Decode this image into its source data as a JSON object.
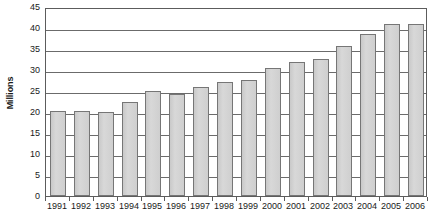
{
  "chart_data": {
    "type": "bar",
    "title": "",
    "subtitle": "",
    "xlabel": "",
    "ylabel": "Millions",
    "categories": [
      "1991",
      "1992",
      "1993",
      "1994",
      "1995",
      "1996",
      "1997",
      "1998",
      "1999",
      "2000",
      "2001",
      "2002",
      "2003",
      "2004",
      "2005",
      "2006"
    ],
    "values": [
      20.2,
      20.3,
      20.0,
      22.4,
      24.9,
      24.3,
      26.0,
      27.1,
      27.6,
      30.4,
      31.9,
      32.5,
      35.6,
      38.6,
      41.0,
      41.0
    ],
    "series": [
      {
        "name": "Millions",
        "values": [
          20.2,
          20.3,
          20.0,
          22.4,
          24.9,
          24.3,
          26.0,
          27.1,
          27.6,
          30.4,
          31.9,
          32.5,
          35.6,
          38.6,
          41.0,
          41.0
        ]
      }
    ],
    "ylim": [
      0,
      45
    ],
    "ytick_values": [
      0,
      5,
      10,
      15,
      20,
      25,
      30,
      35,
      40,
      45
    ],
    "ytick_labels": [
      "0",
      "5",
      "10",
      "15",
      "20",
      "25",
      "30",
      "35",
      "40",
      "45"
    ],
    "grid": true,
    "grid_axis": "y",
    "legend": false,
    "legend_position": "none",
    "bar_fill_color": "#d2d2d2",
    "bar_border_color": "#767676",
    "axis_color": "#5c5c5c",
    "grid_color": "#6b6b6b",
    "text_color": "#1a1a1a",
    "background_color": "#ffffff"
  }
}
